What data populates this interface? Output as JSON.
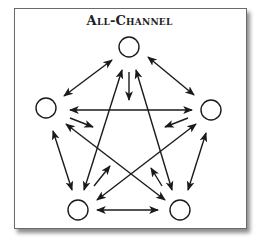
{
  "title": "All-Channel",
  "colors": {
    "stroke": "#1a1a1a",
    "frame_border": "#6a6a6a",
    "background": "#ffffff"
  },
  "nodes": [
    {
      "id": "top",
      "cx": 129,
      "cy": 47,
      "r": 10
    },
    {
      "id": "left",
      "cx": 46,
      "cy": 108,
      "r": 10
    },
    {
      "id": "right",
      "cx": 211,
      "cy": 110,
      "r": 10
    },
    {
      "id": "bottom-left",
      "cx": 78,
      "cy": 210,
      "r": 10
    },
    {
      "id": "bottom-right",
      "cx": 180,
      "cy": 210,
      "r": 10
    }
  ],
  "edges": [
    {
      "from": "top",
      "to": "left",
      "x1": 112,
      "y1": 60,
      "x2": 64,
      "y2": 96,
      "double": true
    },
    {
      "from": "top",
      "to": "right",
      "x1": 148,
      "y1": 57,
      "x2": 194,
      "y2": 95,
      "double": true
    },
    {
      "from": "left",
      "to": "right",
      "x1": 70,
      "y1": 110,
      "x2": 192,
      "y2": 110,
      "double": true
    },
    {
      "from": "left",
      "to": "bottom-left",
      "x1": 53,
      "y1": 131,
      "x2": 72,
      "y2": 190,
      "double": true
    },
    {
      "from": "right",
      "to": "bottom-right",
      "x1": 206,
      "y1": 133,
      "x2": 188,
      "y2": 190,
      "double": true
    },
    {
      "from": "bottom-left",
      "to": "bottom-right",
      "x1": 97,
      "y1": 210,
      "x2": 158,
      "y2": 210,
      "double": true
    },
    {
      "from": "top",
      "to": "center",
      "x1": 129,
      "y1": 72,
      "x2": 129,
      "y2": 100,
      "double": false
    },
    {
      "from": "bottom-left",
      "to": "top",
      "x1": 84,
      "y1": 190,
      "x2": 122,
      "y2": 70,
      "double": true
    },
    {
      "from": "bottom-right",
      "to": "top",
      "x1": 172,
      "y1": 190,
      "x2": 136,
      "y2": 70,
      "double": true
    },
    {
      "from": "left",
      "to": "bottom-right",
      "x1": 66,
      "y1": 124,
      "x2": 165,
      "y2": 200,
      "double": true
    },
    {
      "from": "right",
      "to": "bottom-left",
      "x1": 196,
      "y1": 124,
      "x2": 97,
      "y2": 200,
      "double": true
    },
    {
      "from": "left",
      "to": "center",
      "x1": 70,
      "y1": 118,
      "x2": 93,
      "y2": 127,
      "double": false
    },
    {
      "from": "right",
      "to": "center",
      "x1": 188,
      "y1": 118,
      "x2": 165,
      "y2": 127,
      "double": false
    },
    {
      "from": "bottom-left",
      "to": "center",
      "x1": 94,
      "y1": 186,
      "x2": 110,
      "y2": 166,
      "double": false
    },
    {
      "from": "bottom-right",
      "to": "center",
      "x1": 162,
      "y1": 186,
      "x2": 151,
      "y2": 168,
      "double": false
    }
  ]
}
